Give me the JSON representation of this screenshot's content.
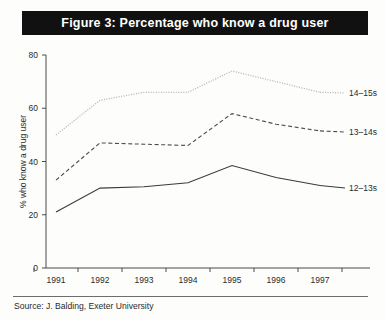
{
  "figure": {
    "title": "Figure 3: Percentage who know a drug user",
    "source": "Source: J. Balding, Exeter University"
  },
  "chart_data": {
    "type": "line",
    "title": "Figure 3: Percentage who know a drug user",
    "xlabel": "",
    "ylabel": "% who know a drug user",
    "categories": [
      "1991",
      "1992",
      "1993",
      "1994",
      "1995",
      "1996",
      "1997"
    ],
    "x": [
      1991,
      1992,
      1993,
      1994,
      1995,
      1996,
      1997
    ],
    "ylim": [
      0,
      80
    ],
    "yticks": [
      0,
      20,
      40,
      60,
      80
    ],
    "grid": false,
    "legend_position": "right-inline",
    "series": [
      {
        "name": "14-15s",
        "label": "14–15s",
        "style": "dotted",
        "color": "#b4b4b4",
        "values": [
          50,
          63,
          66,
          66,
          74,
          70,
          66
        ]
      },
      {
        "name": "13-14s",
        "label": "13–14s",
        "style": "dashed",
        "color": "#4d4d4d",
        "values": [
          33,
          47,
          46.5,
          46,
          58,
          54,
          51.5
        ]
      },
      {
        "name": "12-13s",
        "label": "12–13s",
        "style": "solid",
        "color": "#3b3b3b",
        "values": [
          21,
          30,
          30.5,
          32,
          38.5,
          34,
          31
        ]
      }
    ]
  }
}
